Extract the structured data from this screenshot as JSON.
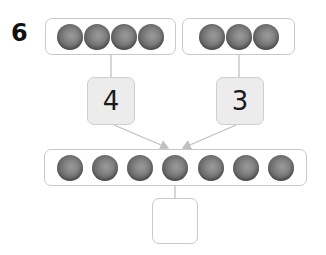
{
  "question": {
    "number": "6"
  },
  "parts": {
    "left": {
      "marble_count": 4,
      "value": "4"
    },
    "right": {
      "marble_count": 3,
      "value": "3"
    }
  },
  "whole": {
    "marble_count": 7,
    "answer": ""
  },
  "colors": {
    "box_border": "#c8c8c8",
    "number_box_fill": "#ececec",
    "marble": "#6e6e6e",
    "line": "#c0c0c0"
  }
}
